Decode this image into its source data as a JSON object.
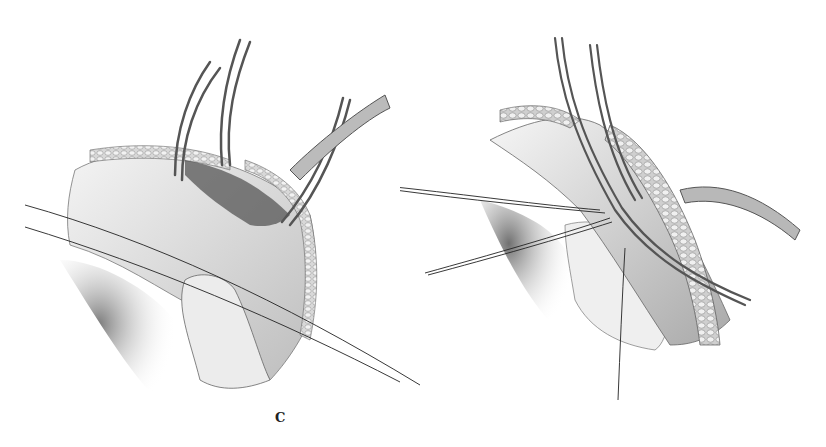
{
  "figure": {
    "panels": [
      {
        "label": "C",
        "description": "Surgical illustration: curved clamps retracting tissue with suture lines crossing"
      },
      {
        "label": "D",
        "description": "Surgical illustration: forceps along vessel with fatty tissue, sutures, and tube"
      }
    ]
  }
}
